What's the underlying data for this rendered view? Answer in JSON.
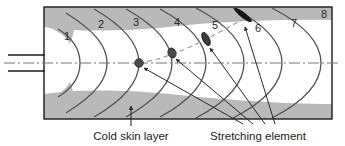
{
  "figure": {
    "kind": "injection-mould-flow-front-diagram",
    "colors": {
      "background": "#ffffff",
      "frame": "#1a1a1a",
      "cold_skin": "#b9b9b9",
      "cold_skin_edge": "#a8a8a8",
      "melt": "#ffffff",
      "flow_front_line": "#555555",
      "centerline": "#777777",
      "tracer_path": "#9a9a9a",
      "element_fill": "#4a4a4a",
      "element_dark": "#141414",
      "leader": "#2b2b2b",
      "text": "#1c1c1c"
    }
  },
  "flow_fronts": {
    "label_note": "Successive positions of the advancing melt front",
    "numbers": [
      "1",
      "2",
      "3",
      "4",
      "5",
      "6",
      "7",
      "8"
    ]
  },
  "stretching_elements": [
    {
      "at_front": "3",
      "shape": "circle",
      "note": "undeformed element on centreline"
    },
    {
      "at_front": "4",
      "shape": "ellipse",
      "note": "slightly elongated"
    },
    {
      "at_front": "5",
      "shape": "ellipse",
      "note": "elongated and tilted"
    },
    {
      "at_front": "6",
      "shape": "streak",
      "note": "strongly stretched near wall"
    }
  ],
  "annotations": {
    "cold_skin_label": "Cold skin layer",
    "stretching_element_label": "Stretching element"
  },
  "nozzle": {
    "name": "gate / nozzle inlet"
  }
}
